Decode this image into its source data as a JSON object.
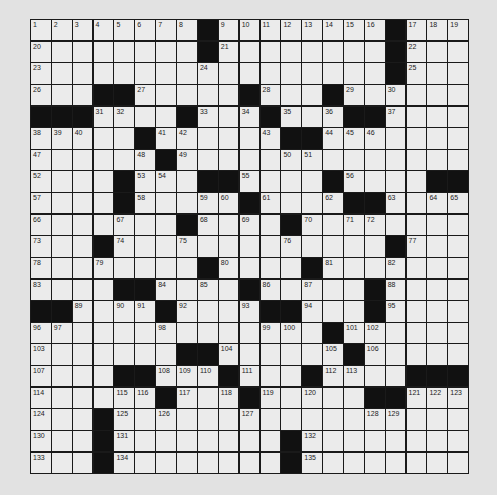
{
  "puzzle": {
    "rows": 21,
    "cols": 21,
    "colors": {
      "background": "#e2e2e2",
      "cell": "#ebebeb",
      "block": "#111111",
      "grid_line": "#1a1a1a"
    },
    "grid": [
      [
        "1",
        "2",
        "3",
        "4",
        "5",
        "6",
        "7",
        "8",
        "#",
        "9",
        "10",
        "11",
        "12",
        "13",
        "14",
        "15",
        "16",
        "#",
        "17",
        "18",
        "19"
      ],
      [
        "20",
        "",
        "",
        "",
        "",
        "",
        "",
        "",
        "#",
        "21",
        "",
        "",
        "",
        "",
        "",
        "",
        "",
        "#",
        "22",
        "",
        ""
      ],
      [
        "23",
        "",
        "",
        "",
        "",
        "",
        "",
        "",
        "24",
        "",
        "",
        "",
        "",
        "",
        "",
        "",
        "",
        "#",
        "25",
        "",
        ""
      ],
      [
        "26",
        "",
        "",
        "#",
        "#",
        "27",
        "",
        "",
        "",
        "",
        "#",
        "28",
        "",
        "",
        "#",
        "29",
        "",
        "30",
        "",
        "",
        ""
      ],
      [
        "#",
        "#",
        "#",
        "31",
        "32",
        "",
        "",
        "#",
        "33",
        "",
        "34",
        "#",
        "35",
        "",
        "36",
        "#",
        "#",
        "37",
        "",
        "",
        ""
      ],
      [
        "38",
        "39",
        "40",
        "",
        "",
        "#",
        "41",
        "42",
        "",
        "",
        "",
        "43",
        "#",
        "#",
        "44",
        "45",
        "46",
        "",
        "",
        "",
        ""
      ],
      [
        "47",
        "",
        "",
        "",
        "",
        "48",
        "#",
        "49",
        "",
        "",
        "",
        "",
        "50",
        "51",
        "",
        "",
        "",
        "",
        "",
        "",
        ""
      ],
      [
        "52",
        "",
        "",
        "",
        "#",
        "53",
        "54",
        "",
        "#",
        "#",
        "55",
        "",
        "",
        "",
        "#",
        "56",
        "",
        "",
        "",
        "#",
        "#"
      ],
      [
        "57",
        "",
        "",
        "",
        "#",
        "58",
        "",
        "",
        "59",
        "60",
        "#",
        "61",
        "",
        "",
        "62",
        "#",
        "#",
        "63",
        "",
        "64",
        "65"
      ],
      [
        "66",
        "",
        "",
        "",
        "67",
        "",
        "",
        "#",
        "68",
        "",
        "69",
        "",
        "#",
        "70",
        "",
        "71",
        "72",
        "",
        "",
        "",
        ""
      ],
      [
        "73",
        "",
        "",
        "#",
        "74",
        "",
        "",
        "75",
        "",
        "",
        "",
        "",
        "76",
        "",
        "",
        "",
        "",
        "#",
        "77",
        "",
        ""
      ],
      [
        "78",
        "",
        "",
        "79",
        "",
        "",
        "",
        "",
        "#",
        "80",
        "",
        "",
        "",
        "#",
        "81",
        "",
        "",
        "82",
        "",
        "",
        ""
      ],
      [
        "83",
        "",
        "",
        "",
        "#",
        "#",
        "84",
        "",
        "85",
        "",
        "#",
        "86",
        "",
        "87",
        "",
        "",
        "#",
        "88",
        "",
        "",
        ""
      ],
      [
        "#",
        "#",
        "89",
        "",
        "90",
        "91",
        "#",
        "92",
        "",
        "",
        "93",
        "#",
        "#",
        "94",
        "",
        "",
        "#",
        "95",
        "",
        "",
        ""
      ],
      [
        "96",
        "97",
        "",
        "",
        "",
        "",
        "98",
        "",
        "",
        "",
        "",
        "99",
        "100",
        "",
        "#",
        "101",
        "102",
        "",
        "",
        "",
        ""
      ],
      [
        "103",
        "",
        "",
        "",
        "",
        "",
        "",
        "#",
        "#",
        "104",
        "",
        "",
        "",
        "",
        "105",
        "#",
        "106",
        "",
        "",
        "",
        ""
      ],
      [
        "107",
        "",
        "",
        "",
        "#",
        "#",
        "108",
        "109",
        "110",
        "#",
        "111",
        "",
        "",
        "#",
        "112",
        "113",
        "",
        "",
        "#",
        "#",
        "#"
      ],
      [
        "114",
        "",
        "",
        "",
        "115",
        "116",
        "#",
        "117",
        "",
        "118",
        "#",
        "119",
        "",
        "120",
        "",
        "",
        "#",
        "#",
        "121",
        "122",
        "123"
      ],
      [
        "124",
        "",
        "",
        "#",
        "125",
        "",
        "126",
        "",
        "",
        "",
        "127",
        "",
        "",
        "",
        "",
        "",
        "128",
        "129",
        "",
        "",
        ""
      ],
      [
        "130",
        "",
        "",
        "#",
        "131",
        "",
        "",
        "",
        "",
        "",
        "",
        "",
        "#",
        "132",
        "",
        "",
        "",
        "",
        "",
        "",
        ""
      ],
      [
        "133",
        "",
        "",
        "#",
        "134",
        "",
        "",
        "",
        "",
        "",
        "",
        "",
        "#",
        "135",
        "",
        "",
        "",
        "",
        "",
        "",
        ""
      ]
    ]
  }
}
